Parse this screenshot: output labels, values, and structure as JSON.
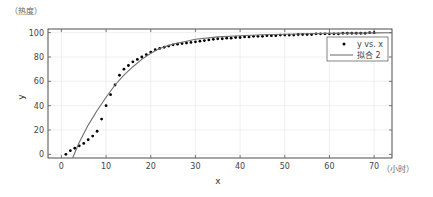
{
  "chart_data": {
    "type": "scatter",
    "title": "",
    "xlabel": "x",
    "ylabel": "y",
    "y_unit_annotation": "（热度）",
    "x_unit_annotation": "（小时）",
    "xlim": [
      -3,
      74
    ],
    "ylim": [
      -3,
      103
    ],
    "xticks": [
      0,
      10,
      20,
      30,
      40,
      50,
      60,
      70
    ],
    "yticks": [
      0,
      20,
      40,
      60,
      80,
      100
    ],
    "grid": true,
    "legend_position": "upper right (inside)",
    "series": [
      {
        "name": "y vs. x",
        "kind": "markers",
        "x": [
          1,
          2,
          3,
          4,
          5,
          6,
          7,
          8,
          9,
          10,
          11,
          12,
          13,
          14,
          15,
          16,
          17,
          18,
          19,
          20,
          21,
          22,
          23,
          24,
          25,
          26,
          27,
          28,
          29,
          30,
          31,
          32,
          33,
          34,
          35,
          36,
          37,
          38,
          39,
          40,
          41,
          42,
          43,
          44,
          45,
          46,
          47,
          48,
          49,
          50,
          51,
          52,
          53,
          54,
          55,
          56,
          57,
          58,
          59,
          60,
          61,
          62,
          63,
          64,
          65,
          66,
          67,
          68,
          69,
          70
        ],
        "y": [
          0,
          3,
          5,
          7,
          9,
          12,
          15,
          19,
          29,
          40,
          49,
          57,
          65,
          70,
          73,
          76,
          78,
          80,
          82,
          84,
          86,
          87,
          88,
          89,
          90,
          90.5,
          91,
          91.5,
          92,
          92.5,
          93,
          93.5,
          94,
          94.5,
          95,
          95,
          95.5,
          95.5,
          96,
          96,
          96.5,
          96.5,
          97,
          97,
          97,
          97.5,
          97.5,
          97.5,
          98,
          98,
          98,
          98,
          98.5,
          98.5,
          98.5,
          98.5,
          99,
          99,
          99,
          99,
          99,
          99,
          99.5,
          99.5,
          99.5,
          99.5,
          99.5,
          99.5,
          100,
          100
        ]
      },
      {
        "name": "拟合 2",
        "kind": "line",
        "x": [
          2.5,
          4,
          6,
          8,
          10,
          12,
          14,
          16,
          18,
          20,
          22,
          24,
          26,
          28,
          30,
          35,
          40,
          45,
          50,
          55,
          60,
          65,
          70,
          74
        ],
        "y": [
          -3,
          10,
          24,
          36,
          47,
          57,
          65,
          72,
          78,
          83,
          87,
          89.5,
          91.5,
          93,
          94.5,
          96.5,
          97.5,
          98.2,
          98.7,
          99.1,
          99.4,
          99.6,
          99.8,
          100
        ]
      }
    ]
  },
  "legend": {
    "items": [
      "y vs. x",
      "拟合 2"
    ]
  }
}
